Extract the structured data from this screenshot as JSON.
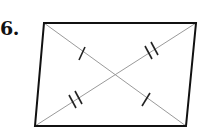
{
  "problem": {
    "number": "6."
  },
  "diagram": {
    "shape": "parallelogram",
    "vertices": [
      [
        44,
        23
      ],
      [
        196,
        23
      ],
      [
        186,
        126
      ],
      [
        35,
        126
      ]
    ],
    "diagonals": [
      {
        "from": [
          44,
          23
        ],
        "to": [
          186,
          126
        ],
        "tick_marks": 1
      },
      {
        "from": [
          196,
          23
        ],
        "to": [
          35,
          126
        ],
        "tick_marks": 2
      }
    ],
    "intersection": [
      116,
      75
    ],
    "stroke_color": "#111111",
    "diagonal_color": "#999999"
  }
}
